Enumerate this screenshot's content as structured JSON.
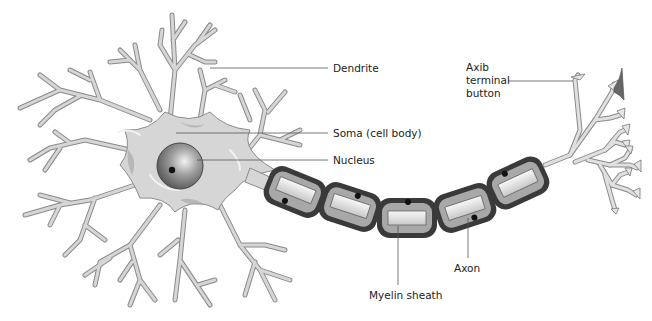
{
  "diagram": {
    "labels": {
      "dendrite": "Dendrite",
      "soma": "Soma (cell body)",
      "nucleus": "Nucleus",
      "axon_terminal_line1": "Axib",
      "axon_terminal_line2": "terminal",
      "axon_terminal_line3": "button",
      "axon": "Axon",
      "myelin_sheath": "Myelin sheath"
    },
    "colors": {
      "cell_fill": "#d6d6d6",
      "cell_stroke": "#8a8a8a",
      "sheath_outer": "#3a3a3a",
      "sheath_inner": "#a8a8a8",
      "axon_core": "#eeeeee",
      "leader_line": "#555555",
      "text": "#222222"
    }
  }
}
